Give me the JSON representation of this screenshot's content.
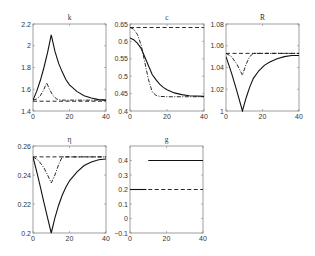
{
  "figure": {
    "width": 315,
    "height": 256,
    "background": "#ffffff",
    "axis_color": "#888888",
    "line_color": "#111111"
  },
  "chart_data": [
    {
      "type": "line",
      "title": "k",
      "box": {
        "x0": 33,
        "y0": 24,
        "x1": 106,
        "y1": 111
      },
      "xlim": [
        0,
        40
      ],
      "ylim": [
        1.4,
        2.2
      ],
      "xticks": [
        0,
        20,
        40
      ],
      "xtick_labels": [
        "0",
        "20",
        "40"
      ],
      "yticks": [
        1.4,
        1.6,
        1.8,
        2.0,
        2.2
      ],
      "ytick_labels": [
        "1.4",
        "1.6",
        "1.8",
        "2",
        "2.2"
      ],
      "grid": false,
      "series": [
        {
          "name": "solid",
          "style": "solid",
          "x": [
            0,
            2,
            4,
            6,
            8,
            10,
            12,
            14,
            16,
            18,
            20,
            24,
            28,
            32,
            36,
            40
          ],
          "y": [
            1.5,
            1.58,
            1.68,
            1.8,
            1.94,
            2.1,
            1.95,
            1.84,
            1.76,
            1.69,
            1.64,
            1.58,
            1.54,
            1.52,
            1.505,
            1.5
          ]
        },
        {
          "name": "dash-dot",
          "style": "dashdot",
          "x": [
            0,
            2,
            4,
            6,
            7.5,
            9,
            11,
            13,
            15,
            20,
            40
          ],
          "y": [
            1.5,
            1.51,
            1.54,
            1.6,
            1.66,
            1.6,
            1.54,
            1.51,
            1.5,
            1.5,
            1.5
          ]
        },
        {
          "name": "dashed",
          "style": "dashed",
          "x": [
            0,
            40
          ],
          "y": [
            1.49,
            1.49
          ]
        }
      ]
    },
    {
      "type": "line",
      "title": "c",
      "box": {
        "x0": 130,
        "y0": 24,
        "x1": 204,
        "y1": 111
      },
      "xlim": [
        0,
        40
      ],
      "ylim": [
        0.4,
        0.65
      ],
      "xticks": [
        0,
        20,
        40
      ],
      "xtick_labels": [
        "0",
        "20",
        "40"
      ],
      "yticks": [
        0.4,
        0.45,
        0.5,
        0.55,
        0.6,
        0.65
      ],
      "ytick_labels": [
        "0.4",
        "0.45",
        "0.5",
        "0.55",
        "0.6",
        "0.65"
      ],
      "grid": false,
      "series": [
        {
          "name": "solid",
          "style": "solid",
          "x": [
            0,
            2,
            4,
            6,
            8,
            10,
            12,
            14,
            16,
            18,
            20,
            24,
            28,
            32,
            36,
            40
          ],
          "y": [
            0.61,
            0.605,
            0.595,
            0.58,
            0.555,
            0.53,
            0.505,
            0.49,
            0.477,
            0.468,
            0.461,
            0.452,
            0.447,
            0.444,
            0.443,
            0.442
          ]
        },
        {
          "name": "dash-dot",
          "style": "dashdot",
          "x": [
            0,
            2,
            4,
            6,
            8,
            10,
            12,
            14,
            16,
            20,
            40
          ],
          "y": [
            0.64,
            0.635,
            0.62,
            0.59,
            0.54,
            0.49,
            0.455,
            0.445,
            0.442,
            0.441,
            0.441
          ]
        },
        {
          "name": "dashed",
          "style": "dashed",
          "x": [
            0,
            40
          ],
          "y": [
            0.64,
            0.64
          ]
        }
      ]
    },
    {
      "type": "line",
      "title": "R̄",
      "box": {
        "x0": 226,
        "y0": 24,
        "x1": 299,
        "y1": 111
      },
      "xlim": [
        0,
        40
      ],
      "ylim": [
        1.0,
        1.08
      ],
      "xticks": [
        0,
        20,
        40
      ],
      "xtick_labels": [
        "0",
        "20",
        "40"
      ],
      "yticks": [
        1.0,
        1.02,
        1.04,
        1.06,
        1.08
      ],
      "ytick_labels": [
        "1",
        "1.02",
        "1.04",
        "1.06",
        "1.08"
      ],
      "grid": false,
      "series": [
        {
          "name": "solid",
          "style": "solid",
          "x": [
            0,
            3,
            6,
            9,
            11,
            13,
            15,
            18,
            21,
            24,
            28,
            32,
            36,
            40
          ],
          "y": [
            1.05,
            1.035,
            1.018,
            1.0,
            1.012,
            1.022,
            1.03,
            1.037,
            1.042,
            1.045,
            1.048,
            1.05,
            1.051,
            1.051
          ]
        },
        {
          "name": "dash-dot",
          "style": "dashdot",
          "x": [
            0,
            3,
            6,
            9,
            11,
            13,
            15,
            40
          ],
          "y": [
            1.053,
            1.05,
            1.043,
            1.033,
            1.043,
            1.05,
            1.053,
            1.053
          ]
        },
        {
          "name": "dashed",
          "style": "dashed",
          "x": [
            0,
            40
          ],
          "y": [
            1.053,
            1.053
          ]
        }
      ]
    },
    {
      "type": "line",
      "title": "η",
      "box": {
        "x0": 33,
        "y0": 146,
        "x1": 106,
        "y1": 233
      },
      "xlim": [
        0,
        40
      ],
      "ylim": [
        0.2,
        0.26
      ],
      "xticks": [
        0,
        20,
        40
      ],
      "xtick_labels": [
        "0",
        "20",
        "40"
      ],
      "yticks": [
        0.2,
        0.22,
        0.24,
        0.26
      ],
      "ytick_labels": [
        "0.2",
        "0.22",
        "0.24",
        "0.26"
      ],
      "grid": false,
      "series": [
        {
          "name": "solid",
          "style": "solid",
          "x": [
            0,
            2,
            4,
            6,
            8,
            10,
            12,
            14,
            16,
            18,
            20,
            24,
            28,
            32,
            36,
            40
          ],
          "y": [
            0.2525,
            0.2425,
            0.232,
            0.221,
            0.2105,
            0.2,
            0.2105,
            0.219,
            0.226,
            0.2315,
            0.236,
            0.242,
            0.2465,
            0.249,
            0.2505,
            0.251
          ]
        },
        {
          "name": "dash-dot",
          "style": "dashdot",
          "x": [
            0,
            3,
            6,
            8,
            10,
            12,
            14,
            16,
            40
          ],
          "y": [
            0.2525,
            0.25,
            0.245,
            0.24,
            0.2345,
            0.24,
            0.247,
            0.2525,
            0.2525
          ]
        },
        {
          "name": "dashed",
          "style": "dashed",
          "x": [
            0,
            40
          ],
          "y": [
            0.2525,
            0.2525
          ]
        }
      ]
    },
    {
      "type": "line",
      "title": "g",
      "box": {
        "x0": 130,
        "y0": 146,
        "x1": 203,
        "y1": 233
      },
      "xlim": [
        0,
        40
      ],
      "ylim": [
        -0.1,
        0.5
      ],
      "xticks": [
        0,
        20,
        40
      ],
      "xtick_labels": [
        "0",
        "20",
        "40"
      ],
      "yticks": [
        -0.1,
        0,
        0.1,
        0.2,
        0.3,
        0.4
      ],
      "ytick_labels": [
        "-0.1",
        "0",
        "0.1",
        "0.2",
        "0.3",
        "0.4"
      ],
      "grid": false,
      "series": [
        {
          "name": "solid-early",
          "style": "solid",
          "x": [
            0,
            9
          ],
          "y": [
            0.2,
            0.2
          ]
        },
        {
          "name": "solid-late",
          "style": "solid",
          "x": [
            10,
            40
          ],
          "y": [
            0.4,
            0.4
          ]
        },
        {
          "name": "dashed",
          "style": "dashed",
          "x": [
            10,
            40
          ],
          "y": [
            0.2,
            0.2
          ]
        }
      ]
    }
  ]
}
